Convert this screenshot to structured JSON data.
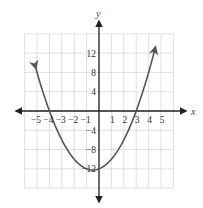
{
  "chart_data": {
    "type": "line",
    "title": "",
    "xlabel": "x",
    "ylabel": "y",
    "function": "y = x^2 + x - 12",
    "roots": [
      -4,
      3
    ],
    "vertex": [
      -0.5,
      -12.25
    ],
    "y_intercept": -12,
    "xlim": [
      -6,
      6
    ],
    "ylim": [
      -16,
      16
    ],
    "grid": true,
    "x_ticks": [
      -5,
      -4,
      -3,
      -2,
      -1,
      1,
      2,
      3,
      4,
      5
    ],
    "x_tick_labels": [
      "−5",
      "−4",
      "−3",
      "−2",
      "−1",
      "1",
      "2",
      "3",
      "4",
      "5"
    ],
    "y_ticks": [
      12,
      8,
      4,
      -4,
      -8,
      -12
    ],
    "y_tick_labels": [
      "12",
      "8",
      "4",
      "−4",
      "−8",
      "−12"
    ],
    "series": [
      {
        "name": "parabola",
        "x": [
          -5,
          -4.5,
          -4,
          -3,
          -2,
          -1,
          -0.5,
          0,
          1,
          2,
          3,
          4,
          4.5
        ],
        "y": [
          8,
          3.75,
          0,
          -6,
          -10,
          -12,
          -12.25,
          -12,
          -10,
          -6,
          0,
          8,
          12.75
        ]
      }
    ],
    "colors": {
      "curve": "#555555",
      "axes": "#222222",
      "grid": "#d8d8d8"
    }
  }
}
